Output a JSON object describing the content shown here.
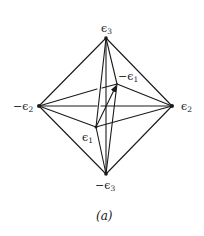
{
  "figure": {
    "caption": "(a)",
    "vertices": {
      "e3": {
        "label": "ϵ",
        "sub": "3",
        "prefix": "",
        "x": 106,
        "y": 38
      },
      "ne3": {
        "label": "ϵ",
        "sub": "3",
        "prefix": "−",
        "x": 106,
        "y": 174
      },
      "ne2": {
        "label": "ϵ",
        "sub": "2",
        "prefix": "−",
        "x": 39,
        "y": 106
      },
      "e2": {
        "label": "ϵ",
        "sub": "2",
        "prefix": "",
        "x": 172,
        "y": 106
      },
      "e1": {
        "label": "ϵ",
        "sub": "1",
        "prefix": "",
        "x": 96,
        "y": 127
      },
      "ne1": {
        "label": "ϵ",
        "sub": "1",
        "prefix": "−",
        "x": 117,
        "y": 84
      }
    },
    "labels": {
      "e3": "ϵ3",
      "ne3": "−ϵ3",
      "ne2": "−ϵ2",
      "e2": "ϵ2",
      "e1": "ϵ1",
      "ne1": "−ϵ1"
    },
    "arrow": {
      "from": "e1",
      "to": "ne1"
    }
  }
}
